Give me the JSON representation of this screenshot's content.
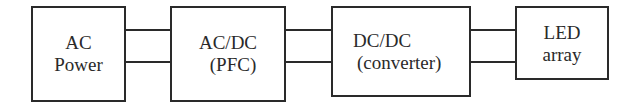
{
  "diagram": {
    "title": "",
    "blocks": [
      {
        "id": "ac-power",
        "lines": [
          "AC",
          "Power"
        ]
      },
      {
        "id": "ac-dc-pfc",
        "lines": [
          "AC/DC",
          "(PFC)"
        ]
      },
      {
        "id": "dc-dc-converter",
        "lines": [
          "DC/DC",
          "(converter)"
        ]
      },
      {
        "id": "led-array",
        "lines": [
          "LED",
          "array"
        ]
      }
    ],
    "connections": [
      {
        "from": "ac-power",
        "to": "ac-dc-pfc",
        "wires": 2
      },
      {
        "from": "ac-dc-pfc",
        "to": "dc-dc-converter",
        "wires": 2
      },
      {
        "from": "dc-dc-converter",
        "to": "led-array",
        "wires": 2
      }
    ],
    "colors": {
      "line": "#2a2a2a",
      "background": "#ffffff"
    }
  }
}
